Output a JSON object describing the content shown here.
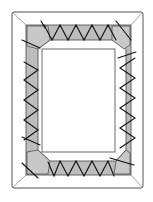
{
  "diagram": {
    "title": "",
    "colors": {
      "background": "#ffffff",
      "frame_stroke": "#555555",
      "fabric_fill": "#bdbdbd",
      "lacing_stroke": "#111111",
      "window_fill": "#ffffff"
    },
    "parts": [
      {
        "id": "outer-frame",
        "label": ""
      },
      {
        "id": "fabric-band",
        "label": ""
      },
      {
        "id": "inner-window",
        "label": ""
      },
      {
        "id": "lacing",
        "label": ""
      }
    ]
  }
}
